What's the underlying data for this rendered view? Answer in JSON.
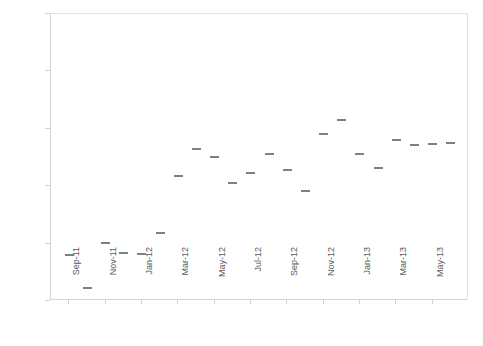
{
  "chart_data": {
    "type": "scatter",
    "title": "",
    "xlabel": "",
    "ylabel": "Blog views (proportion of total website views)",
    "ylim": [
      0,
      0.5
    ],
    "ytick_labels": [
      "0",
      "0.1",
      "0.2",
      "0.3",
      "0.4",
      "0.5"
    ],
    "ytick_values": [
      0,
      0.1,
      0.2,
      0.3,
      0.4,
      0.5
    ],
    "grid": false,
    "legend": "none",
    "marker_style": "horizontal-dash",
    "marker_color": "#808080",
    "categories": [
      "Sep-11",
      "Oct-11",
      "Nov-11",
      "Dec-11",
      "Jan-12",
      "Feb-12",
      "Mar-12",
      "Apr-12",
      "May-12",
      "Jun-12",
      "Jul-12",
      "Aug-12",
      "Sep-12",
      "Oct-12",
      "Nov-12",
      "Dec-12",
      "Jan-13",
      "Feb-13",
      "Mar-13",
      "Apr-13",
      "May-13",
      "Jun-13"
    ],
    "values": [
      0.08,
      0.023,
      0.101,
      0.084,
      0.082,
      0.118,
      0.218,
      0.265,
      0.251,
      0.206,
      0.223,
      0.256,
      0.228,
      0.192,
      0.291,
      0.315,
      0.256,
      0.232,
      0.28,
      0.272,
      0.274,
      0.276
    ],
    "xtick_labels": [
      "Sep-11",
      "Nov-11",
      "Jan-12",
      "Mar-12",
      "May-12",
      "Jul-12",
      "Sep-12",
      "Nov-12",
      "Jan-13",
      "Mar-13",
      "May-13"
    ],
    "xtick_indices": [
      0,
      2,
      4,
      6,
      8,
      10,
      12,
      14,
      16,
      18,
      20
    ]
  },
  "axis": {
    "y_title": "Blog views (proportion of total website views)"
  },
  "colors": {
    "marker": "#808080",
    "axis": "#d4d4d4",
    "text": "#595959",
    "background": "#ffffff"
  }
}
